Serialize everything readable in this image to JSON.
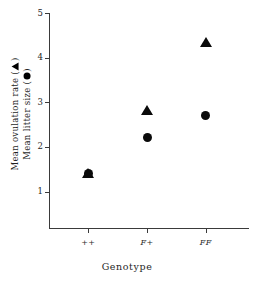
{
  "chart_data": {
    "type": "scatter",
    "title": "",
    "subtitle": "",
    "xlabel": "Genotype",
    "ylabel_lines": [
      "Mean ovulation rate (",
      "Mean litter size ("
    ],
    "ylabel_full": "Mean ovulation rate (▲) / Mean litter size (●)",
    "categories": [
      "++",
      "F+",
      "FF"
    ],
    "ylim": [
      0,
      5
    ],
    "yticks": [
      1,
      2,
      3,
      4,
      5
    ],
    "ytick_labels": [
      "1",
      "2",
      "3",
      "4",
      "5"
    ],
    "grid": false,
    "legend_position": "y-axis-label",
    "series": [
      {
        "name": "Mean ovulation rate",
        "marker": "triangle",
        "marker_color": "#0a0a0a",
        "values": [
          1.42,
          2.82,
          4.35
        ]
      },
      {
        "name": "Mean litter size",
        "marker": "circle",
        "marker_color": "#0a0a0a",
        "values": [
          1.4,
          2.2,
          2.7
        ]
      }
    ]
  },
  "axes": {
    "y_title_line1_prefix": "Mean ovulation rate (",
    "y_title_line1_suffix": ")",
    "y_title_line2_prefix": "Mean litter size (",
    "y_title_line2_suffix": ")",
    "x_title": "Genotype"
  },
  "ticks": {
    "y": [
      {
        "label": "5",
        "value": 5
      },
      {
        "label": "4",
        "value": 4
      },
      {
        "label": "3",
        "value": 3
      },
      {
        "label": "2",
        "value": 2
      },
      {
        "label": "1",
        "value": 1
      }
    ],
    "x": [
      {
        "label": "++",
        "index": 0
      },
      {
        "label": "F+",
        "index": 1
      },
      {
        "label": "FF",
        "index": 2
      }
    ]
  },
  "colors": {
    "marker": "#0a0a0a",
    "axis": "#3a3a3a",
    "text": "#1f1f1f",
    "background": "#ffffff"
  }
}
